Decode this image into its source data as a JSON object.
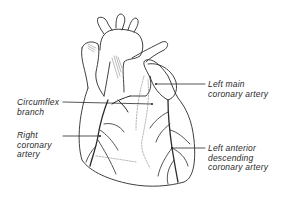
{
  "diagram": {
    "labels": [
      {
        "id": "left-main",
        "text": "Left main\ncoronary artery",
        "x": 208,
        "y": 80
      },
      {
        "id": "circumflex",
        "text": "Circumflex\nbranch",
        "x": 17,
        "y": 98
      },
      {
        "id": "right-coronary",
        "text": "Right\ncoronary\nartery",
        "x": 17,
        "y": 131
      },
      {
        "id": "lad",
        "text": "Left anterior\ndescending\ncoronary artery",
        "x": 208,
        "y": 144
      }
    ],
    "colors": {
      "line": "#2a2a2a",
      "background": "#ffffff"
    }
  }
}
